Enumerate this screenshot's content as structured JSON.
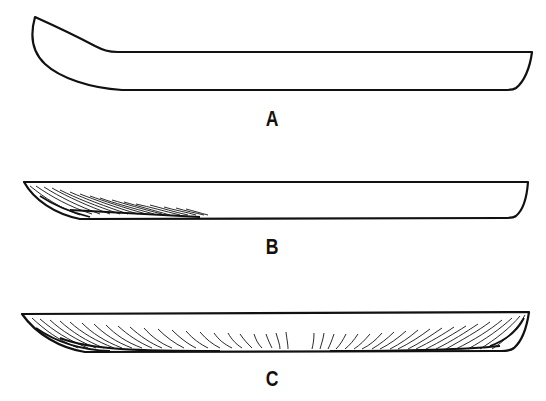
{
  "figure": {
    "line_color": "#111111",
    "background": "#ffffff",
    "panels": [
      {
        "id": "A",
        "label": "A",
        "shading": "none"
      },
      {
        "id": "B",
        "label": "B",
        "shading": "left-end"
      },
      {
        "id": "C",
        "label": "C",
        "shading": "full-underside"
      }
    ]
  }
}
